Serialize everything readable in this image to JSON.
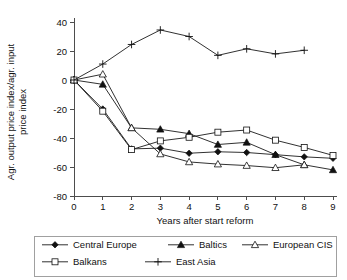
{
  "chart_data": {
    "type": "line",
    "title": "",
    "xlabel": "Years after start reform",
    "ylabel": "Agr. output price index/agr. input price index",
    "x": [
      0,
      1,
      2,
      3,
      4,
      5,
      6,
      7,
      8,
      9
    ],
    "xticklabels": [
      "0",
      "1",
      "2",
      "3",
      "4",
      "5",
      "6",
      "7",
      "8",
      "9"
    ],
    "yticklabels": [
      "40",
      "20",
      "0",
      "-20",
      "-40",
      "-60",
      "-80"
    ],
    "yticks": [
      40,
      20,
      0,
      -20,
      -40,
      -60,
      -80
    ],
    "xlim": [
      0,
      9
    ],
    "ylim": [
      -80,
      40
    ],
    "grid": false,
    "legend_position": "below",
    "series": [
      {
        "name": "Central Europe",
        "marker": "filled-diamond",
        "x": [
          0,
          1,
          2,
          3,
          4,
          5,
          6,
          7,
          8,
          9
        ],
        "values": [
          0,
          -20,
          -47.5,
          -47,
          -50.5,
          -49.5,
          -50,
          -51.5,
          -53,
          -54
        ]
      },
      {
        "name": "Baltics",
        "marker": "filled-triangle",
        "x": [
          0,
          1,
          2,
          3,
          4,
          5,
          6,
          7,
          8,
          9
        ],
        "values": [
          0,
          -3,
          -33,
          -34,
          -37,
          -44.5,
          -43,
          -51.5,
          -58.5,
          -62
        ]
      },
      {
        "name": "European CIS",
        "marker": "open-triangle",
        "x": [
          0,
          1,
          2,
          3,
          4,
          5,
          6,
          7,
          8
        ],
        "values": [
          0,
          4,
          -33,
          -51,
          -56.5,
          -58,
          -59,
          -60.5,
          -58.5
        ]
      },
      {
        "name": "Balkans",
        "marker": "open-square",
        "x": [
          0,
          1,
          2,
          3,
          4,
          5,
          6,
          7,
          8,
          9
        ],
        "values": [
          0,
          -21.5,
          -48,
          -42,
          -39.5,
          -36,
          -34.5,
          -41.5,
          -46.5,
          -52
        ]
      },
      {
        "name": "East Asia",
        "marker": "plus",
        "x": [
          0,
          1,
          2,
          3,
          4,
          5,
          6,
          7,
          8
        ],
        "values": [
          0,
          11,
          24.5,
          34.5,
          30,
          17,
          21.5,
          18,
          20.5
        ]
      }
    ]
  },
  "legend": {
    "items": [
      {
        "label": "Central Europe",
        "marker": "filled-diamond"
      },
      {
        "label": "Baltics",
        "marker": "filled-triangle"
      },
      {
        "label": "European CIS",
        "marker": "open-triangle"
      },
      {
        "label": "Balkans",
        "marker": "open-square"
      },
      {
        "label": "East Asia",
        "marker": "plus"
      }
    ]
  },
  "colors": {
    "line": "#111111",
    "axis": "#4d4d4d",
    "background": "#ffffff",
    "legend_border": "#888888"
  }
}
